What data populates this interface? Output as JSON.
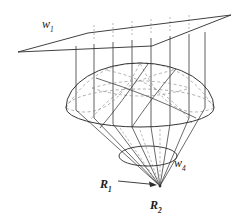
{
  "figure": {
    "background_color": "#ffffff",
    "stroke_color": "#2b2b2b",
    "dashed_color": "#8a8a8a",
    "labels": {
      "plane": {
        "symbol": "w",
        "subscript": "1",
        "full": "w1"
      },
      "small_ellipse": {
        "symbol": "w",
        "subscript": "4",
        "full": "w4"
      },
      "radius_outer": {
        "symbol": "R",
        "subscript": "1",
        "full": "R1"
      },
      "apex": {
        "symbol": "R",
        "subscript": "2",
        "full": "R2"
      }
    },
    "geometry": {
      "plane": {
        "type": "parallelogram",
        "points": [
          [
            18,
            52
          ],
          [
            88,
            33
          ],
          [
            231,
            15
          ],
          [
            152,
            46
          ]
        ]
      },
      "dome": {
        "type": "hemisphere",
        "center": [
          140,
          108
        ],
        "rx": 74,
        "ry": 19,
        "top_y": 63
      },
      "small_ellipse": {
        "center": [
          148,
          156
        ],
        "rx": 29,
        "ry": 10
      },
      "apex_point": [
        160,
        186
      ],
      "ray_count": 7,
      "arrow": {
        "from": [
          118,
          182
        ],
        "to": [
          157,
          185
        ]
      }
    }
  }
}
